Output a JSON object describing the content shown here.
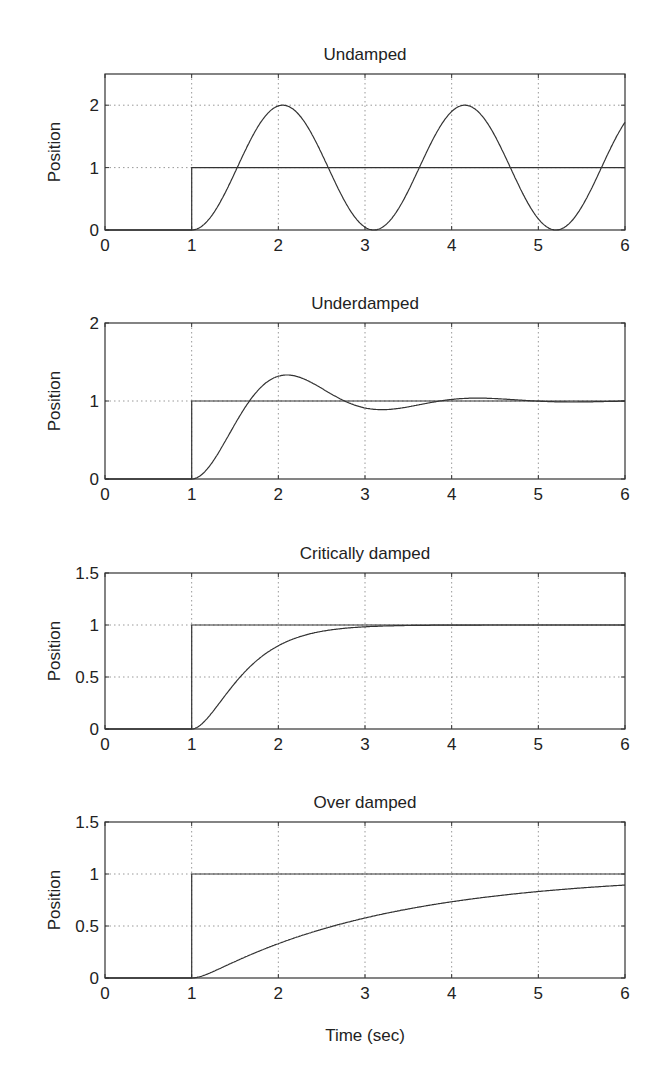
{
  "chart_data": [
    {
      "type": "line",
      "title": "Undamped",
      "xlabel": "",
      "ylabel": "Position",
      "xlim": [
        0,
        6
      ],
      "ylim": [
        0,
        2.5
      ],
      "xticks": [
        "0",
        "1",
        "2",
        "3",
        "4",
        "5",
        "6"
      ],
      "yticks": [
        "0",
        "1",
        "2"
      ],
      "grid": true,
      "series": [
        {
          "name": "step input",
          "x": [
            0,
            1,
            1,
            6
          ],
          "y": [
            0,
            0,
            1,
            1
          ]
        },
        {
          "name": "response",
          "x": [
            0,
            1,
            1.5,
            2.05,
            2.6,
            3.1,
            3.6,
            4.15,
            4.7,
            5.2,
            5.7,
            6
          ],
          "y": [
            0,
            0,
            1.0,
            2.0,
            1.0,
            0,
            1.0,
            2.0,
            1.0,
            0,
            1.0,
            1.74
          ]
        }
      ]
    },
    {
      "type": "line",
      "title": "Underdamped",
      "xlabel": "",
      "ylabel": "Position",
      "xlim": [
        0,
        6
      ],
      "ylim": [
        0,
        2
      ],
      "xticks": [
        "0",
        "1",
        "2",
        "3",
        "4",
        "5",
        "6"
      ],
      "yticks": [
        "0",
        "1",
        "2"
      ],
      "grid": true,
      "series": [
        {
          "name": "step input",
          "x": [
            0,
            1,
            1,
            6
          ],
          "y": [
            0,
            0,
            1,
            1
          ]
        },
        {
          "name": "response",
          "x": [
            0,
            1,
            1.5,
            1.7,
            2.1,
            2.7,
            3.2,
            3.8,
            4.3,
            5,
            6
          ],
          "y": [
            0,
            0,
            0.65,
            1.0,
            1.33,
            1.05,
            0.9,
            0.99,
            1.03,
            1.0,
            1.0
          ]
        }
      ]
    },
    {
      "type": "line",
      "title": "Critically damped",
      "xlabel": "",
      "ylabel": "Position",
      "xlim": [
        0,
        6
      ],
      "ylim": [
        0,
        1.5
      ],
      "xticks": [
        "0",
        "1",
        "2",
        "3",
        "4",
        "5",
        "6"
      ],
      "yticks": [
        "0",
        "0.5",
        "1",
        "1.5"
      ],
      "grid": true,
      "series": [
        {
          "name": "step input",
          "x": [
            0,
            1,
            1,
            6
          ],
          "y": [
            0,
            0,
            1,
            1
          ]
        },
        {
          "name": "response",
          "x": [
            0,
            1,
            1.5,
            2,
            2.5,
            3,
            4,
            5,
            6
          ],
          "y": [
            0,
            0,
            0.44,
            0.8,
            0.94,
            0.98,
            1.0,
            1.0,
            1.0
          ]
        }
      ]
    },
    {
      "type": "line",
      "title": "Over damped",
      "xlabel": "Time (sec)",
      "ylabel": "Position",
      "xlim": [
        0,
        6
      ],
      "ylim": [
        0,
        1.5
      ],
      "xticks": [
        "0",
        "1",
        "2",
        "3",
        "4",
        "5",
        "6"
      ],
      "yticks": [
        "0",
        "0.5",
        "1",
        "1.5"
      ],
      "grid": true,
      "series": [
        {
          "name": "step input",
          "x": [
            0,
            1,
            1,
            6
          ],
          "y": [
            0,
            0,
            1,
            1
          ]
        },
        {
          "name": "response",
          "x": [
            0,
            1,
            2,
            3,
            4,
            5,
            6
          ],
          "y": [
            0,
            0,
            0.36,
            0.59,
            0.74,
            0.83,
            0.89
          ]
        }
      ]
    }
  ],
  "xlabel_bottom": "Time (sec)"
}
